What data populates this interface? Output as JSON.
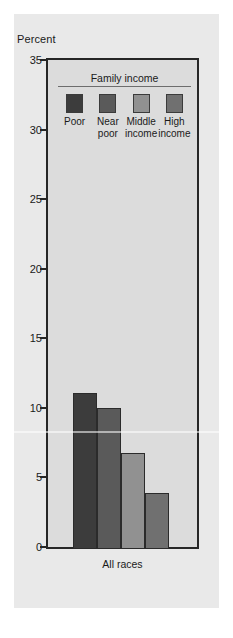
{
  "chart_data": {
    "type": "bar",
    "title": "",
    "ylabel": "Percent",
    "xlabel": "",
    "categories": [
      "All races"
    ],
    "ylim": [
      0,
      35
    ],
    "yticks": [
      0,
      5,
      10,
      15,
      20,
      25,
      30,
      35
    ],
    "grid": false,
    "legend_position": "inside-top",
    "legend_title": "Family income",
    "series": [
      {
        "name": "Poor",
        "values": [
          11.2
        ],
        "color": "#3c3c3c"
      },
      {
        "name": "Near poor",
        "values": [
          10.1
        ],
        "color": "#5a5a5a"
      },
      {
        "name": "Middle income",
        "values": [
          6.9
        ],
        "color": "#919191"
      },
      {
        "name": "High income",
        "values": [
          4.0
        ],
        "color": "#707070"
      }
    ]
  },
  "axis": {
    "title": "Percent",
    "ticks": [
      "35",
      "30",
      "25",
      "20",
      "15",
      "10",
      "5",
      "0"
    ]
  },
  "legend": {
    "title": "Family income",
    "items": [
      {
        "label": "Poor",
        "color": "#3c3c3c"
      },
      {
        "label": "Near\npoor",
        "color": "#5a5a5a"
      },
      {
        "label": "Middle\nincome",
        "color": "#919191"
      },
      {
        "label": "High\nincome",
        "color": "#707070"
      }
    ]
  },
  "xaxis": {
    "category": "All races"
  },
  "colors": {
    "page_background": "#e9e9e9",
    "plot_background": "#dcdcdc",
    "frame": "#262626",
    "text": "#1a1a1a"
  }
}
